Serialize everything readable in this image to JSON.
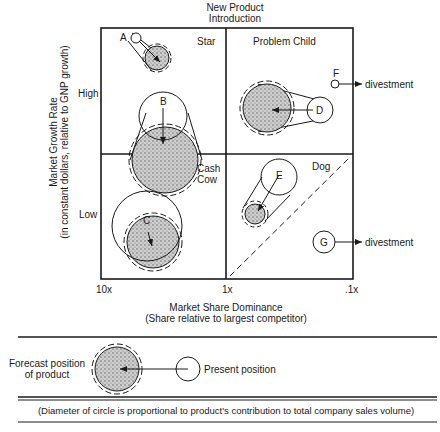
{
  "diagram": {
    "type": "growth-share-matrix",
    "top_label": [
      "New Product",
      "Introduction"
    ],
    "quadrants": {
      "top_left": "Star",
      "top_right": "Problem Child",
      "bottom_left": [
        "Cash",
        "Cow"
      ],
      "bottom_right": "Dog"
    },
    "y_axis": {
      "title": "Market Growth Rate",
      "subtitle": "(in constant dollars, relative to GNP growth)",
      "ticks": [
        "High",
        "Low"
      ]
    },
    "x_axis": {
      "title": "Market Share Dominance",
      "subtitle": "(Share relative to largest competitor)",
      "ticks": [
        "10x",
        "1x",
        ".1x"
      ]
    },
    "products": [
      {
        "id": "A",
        "quadrant": "Star",
        "present": "small circle top-left",
        "forecast": "larger shaded circle"
      },
      {
        "id": "B",
        "quadrant": "Star",
        "present": "circle",
        "forecast": "large shaded circle crossing into Cash Cow"
      },
      {
        "id": "C",
        "quadrant": "Cash Cow",
        "present": "large circle",
        "forecast": "shaded circle"
      },
      {
        "id": "D",
        "quadrant": "Problem Child",
        "present": "circle",
        "forecast": "large shaded circle"
      },
      {
        "id": "E",
        "quadrant": "Dog",
        "present": "circle",
        "forecast": "small shaded circle"
      },
      {
        "id": "F",
        "quadrant": "Problem Child",
        "present": "small circle",
        "forecast": "divestment"
      },
      {
        "id": "G",
        "quadrant": "Dog",
        "present": "circle",
        "forecast": "divestment"
      }
    ],
    "divestment_label": "divestment"
  },
  "legend": {
    "forecast_label": [
      "Forecast position",
      "of product"
    ],
    "present_label": "Present position",
    "note": "(Diameter of circle is proportional to product's contribution to total company sales volume)"
  }
}
